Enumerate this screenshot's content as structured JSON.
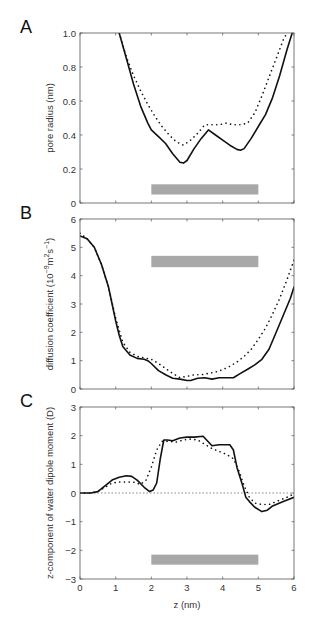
{
  "chart_data": [
    {
      "panel": "A",
      "type": "line",
      "title": "",
      "xlabel": "",
      "ylabel": "pore radius (nm)",
      "xlim": [
        0,
        6
      ],
      "ylim": [
        0,
        1.0
      ],
      "xticks": [
        0,
        1,
        2,
        3,
        4,
        5,
        6
      ],
      "yticks": [
        0,
        0.2,
        0.4,
        0.6,
        0.8,
        1.0
      ],
      "ytick_labels": [
        "0",
        "0.2",
        "0.4",
        "0.6",
        "0.8",
        "1.0"
      ],
      "grid": false,
      "bar": {
        "x0": 2,
        "x1": 5,
        "y0": 0.05,
        "y1": 0.11,
        "color": "#a8a8a8"
      },
      "series": [
        {
          "name": "solid",
          "style": "solid",
          "x": [
            1.1,
            1.3,
            1.5,
            1.7,
            1.9,
            2.0,
            2.2,
            2.4,
            2.6,
            2.8,
            2.9,
            3.0,
            3.2,
            3.4,
            3.6,
            3.8,
            4.0,
            4.2,
            4.4,
            4.5,
            4.6,
            4.8,
            5.0,
            5.2,
            5.4,
            5.6,
            5.8,
            5.95
          ],
          "y": [
            1.0,
            0.85,
            0.7,
            0.57,
            0.47,
            0.43,
            0.39,
            0.35,
            0.29,
            0.24,
            0.235,
            0.25,
            0.32,
            0.38,
            0.43,
            0.4,
            0.37,
            0.34,
            0.315,
            0.31,
            0.32,
            0.38,
            0.45,
            0.52,
            0.62,
            0.75,
            0.9,
            1.0
          ]
        },
        {
          "name": "dotted",
          "style": "dotted",
          "x": [
            1.1,
            1.3,
            1.5,
            1.7,
            1.9,
            2.1,
            2.3,
            2.5,
            2.7,
            2.9,
            3.1,
            3.3,
            3.5,
            3.7,
            3.9,
            4.1,
            4.3,
            4.5,
            4.7,
            4.9,
            5.1,
            5.3,
            5.5,
            5.7,
            5.8
          ],
          "y": [
            1.0,
            0.86,
            0.75,
            0.66,
            0.58,
            0.51,
            0.45,
            0.4,
            0.36,
            0.34,
            0.37,
            0.41,
            0.46,
            0.46,
            0.46,
            0.47,
            0.46,
            0.46,
            0.47,
            0.53,
            0.63,
            0.74,
            0.85,
            0.96,
            1.0
          ]
        }
      ]
    },
    {
      "panel": "B",
      "type": "line",
      "xlabel": "",
      "ylabel": "diffusion coefficient (10⁻⁹m²s⁻¹)",
      "xlim": [
        0,
        6
      ],
      "ylim": [
        0,
        6
      ],
      "xticks": [
        0,
        1,
        2,
        3,
        4,
        5,
        6
      ],
      "yticks": [
        0,
        1,
        2,
        3,
        4,
        5,
        6
      ],
      "ytick_labels": [
        "0",
        "1",
        "2",
        "3",
        "4",
        "5",
        "6"
      ],
      "grid": false,
      "bar": {
        "x0": 2,
        "x1": 5,
        "y0": 4.3,
        "y1": 4.7,
        "color": "#a8a8a8"
      },
      "series": [
        {
          "name": "solid",
          "style": "solid",
          "x": [
            0,
            0.2,
            0.4,
            0.6,
            0.8,
            0.9,
            1.0,
            1.1,
            1.2,
            1.4,
            1.6,
            1.8,
            1.9,
            2.0,
            2.2,
            2.4,
            2.6,
            2.8,
            3.0,
            3.1,
            3.3,
            3.5,
            3.7,
            3.9,
            4.1,
            4.3,
            4.5,
            4.7,
            4.9,
            5.1,
            5.3,
            5.5,
            5.7,
            5.9,
            6.0
          ],
          "y": [
            5.4,
            5.3,
            5.0,
            4.4,
            3.6,
            3.0,
            2.4,
            1.9,
            1.5,
            1.2,
            1.08,
            1.05,
            1.0,
            0.9,
            0.65,
            0.5,
            0.38,
            0.35,
            0.3,
            0.3,
            0.38,
            0.4,
            0.35,
            0.4,
            0.4,
            0.4,
            0.55,
            0.7,
            0.85,
            1.05,
            1.4,
            2.0,
            2.6,
            3.2,
            3.6
          ]
        },
        {
          "name": "dotted",
          "style": "dotted",
          "x": [
            0,
            0.2,
            0.4,
            0.6,
            0.8,
            1.0,
            1.2,
            1.4,
            1.6,
            1.8,
            2.0,
            2.2,
            2.4,
            2.6,
            2.8,
            3.0,
            3.2,
            3.4,
            3.6,
            3.8,
            4.0,
            4.2,
            4.4,
            4.6,
            4.8,
            5.0,
            5.2,
            5.4,
            5.6,
            5.8,
            6.0
          ],
          "y": [
            5.5,
            5.3,
            5.0,
            4.4,
            3.6,
            2.5,
            1.65,
            1.3,
            1.15,
            1.1,
            1.05,
            0.9,
            0.72,
            0.55,
            0.4,
            0.45,
            0.5,
            0.5,
            0.55,
            0.6,
            0.68,
            0.8,
            0.95,
            1.15,
            1.4,
            1.75,
            2.15,
            2.65,
            3.2,
            3.85,
            4.55
          ]
        }
      ]
    },
    {
      "panel": "C",
      "type": "line",
      "xlabel": "z (nm)",
      "ylabel": "z-component of water dipole moment (D)",
      "xlim": [
        0,
        6
      ],
      "ylim": [
        -3,
        3
      ],
      "xticks": [
        0,
        1,
        2,
        3,
        4,
        5,
        6
      ],
      "xtick_labels": [
        "0",
        "1",
        "2",
        "3",
        "4",
        "5",
        "6"
      ],
      "yticks": [
        -3,
        -2,
        -1,
        0,
        1,
        2,
        3
      ],
      "ytick_labels": [
        "−3",
        "−2",
        "−1",
        "0",
        "1",
        "2",
        "3"
      ],
      "grid": false,
      "zero_line": true,
      "bar": {
        "x0": 2,
        "x1": 5,
        "y0": -2.5,
        "y1": -2.15,
        "color": "#a8a8a8"
      },
      "series": [
        {
          "name": "solid",
          "style": "solid",
          "x": [
            0,
            0.3,
            0.5,
            0.7,
            0.9,
            1.1,
            1.3,
            1.45,
            1.6,
            1.8,
            1.95,
            2.05,
            2.15,
            2.25,
            2.35,
            2.45,
            2.6,
            2.8,
            3.0,
            3.2,
            3.45,
            3.55,
            3.7,
            3.9,
            4.2,
            4.3,
            4.4,
            4.55,
            4.65,
            4.75,
            4.9,
            5.1,
            5.25,
            5.4,
            5.7,
            6.0
          ],
          "y": [
            0,
            0,
            0.05,
            0.25,
            0.45,
            0.55,
            0.6,
            0.58,
            0.45,
            0.2,
            0.05,
            0.1,
            0.35,
            1.2,
            1.85,
            1.85,
            1.82,
            1.92,
            1.95,
            1.95,
            1.98,
            1.85,
            1.65,
            1.68,
            1.68,
            1.5,
            0.9,
            0.3,
            -0.15,
            -0.3,
            -0.5,
            -0.65,
            -0.6,
            -0.45,
            -0.3,
            -0.15
          ]
        },
        {
          "name": "dotted",
          "style": "dotted",
          "x": [
            0,
            0.3,
            0.5,
            0.7,
            0.9,
            1.1,
            1.3,
            1.5,
            1.7,
            1.85,
            2.0,
            2.15,
            2.3,
            2.5,
            2.7,
            2.9,
            3.1,
            3.3,
            3.5,
            3.7,
            3.9,
            4.1,
            4.3,
            4.45,
            4.6,
            4.75,
            4.9,
            5.1,
            5.3,
            5.5,
            5.7,
            5.9,
            6.0
          ],
          "y": [
            0,
            0,
            0.05,
            0.2,
            0.35,
            0.38,
            0.38,
            0.38,
            0.3,
            0.45,
            0.9,
            1.5,
            1.8,
            1.8,
            1.78,
            1.85,
            1.88,
            1.85,
            1.7,
            1.55,
            1.45,
            1.35,
            1.2,
            0.8,
            0.25,
            -0.15,
            -0.35,
            -0.4,
            -0.4,
            -0.3,
            -0.2,
            -0.1,
            0.0
          ]
        }
      ]
    }
  ],
  "panels": {
    "A": {
      "letter": "A",
      "ylabel": "pore radius (nm)"
    },
    "B": {
      "letter": "B",
      "ylabel_main": "diffusion coefficient (10",
      "ylabel_exp1": "−9",
      "ylabel_mid": "m",
      "ylabel_exp2": "2",
      "ylabel_s": "s",
      "ylabel_exp3": "−1",
      "ylabel_end": ")"
    },
    "C": {
      "letter": "C",
      "ylabel": "z-component of water dipole moment (D)",
      "xlabel": "z (nm)"
    }
  }
}
